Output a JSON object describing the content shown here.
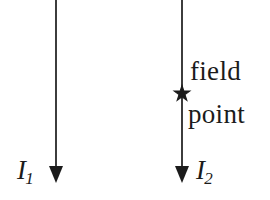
{
  "figure": {
    "kind": "physics-diagram",
    "background_color": "#ffffff",
    "ink_color": "#1b1b1b",
    "width": 270,
    "height": 200
  },
  "wires": [
    {
      "id": "wire-1",
      "current_label": "I",
      "current_subscript": "1",
      "direction": "down",
      "x": 56,
      "line_top_y": 0,
      "line_bottom_y": 166,
      "arrow_tip_y": 183,
      "arrow_half_width": 7,
      "label_side": "left"
    },
    {
      "id": "wire-2",
      "current_label": "I",
      "current_subscript": "2",
      "direction": "down",
      "x": 182,
      "line_top_y": 0,
      "line_bottom_y": 166,
      "arrow_tip_y": 183,
      "arrow_half_width": 7,
      "label_side": "right"
    }
  ],
  "field_point": {
    "marker": "star-marker",
    "points": 5,
    "x": 182,
    "y": 94,
    "outer_radius": 8.5,
    "inner_radius": 3.6,
    "label_line_1": "field",
    "label_line_2": "point",
    "label_side": "right"
  },
  "colors": {
    "ink": "#1b1b1b",
    "background": "#ffffff"
  }
}
